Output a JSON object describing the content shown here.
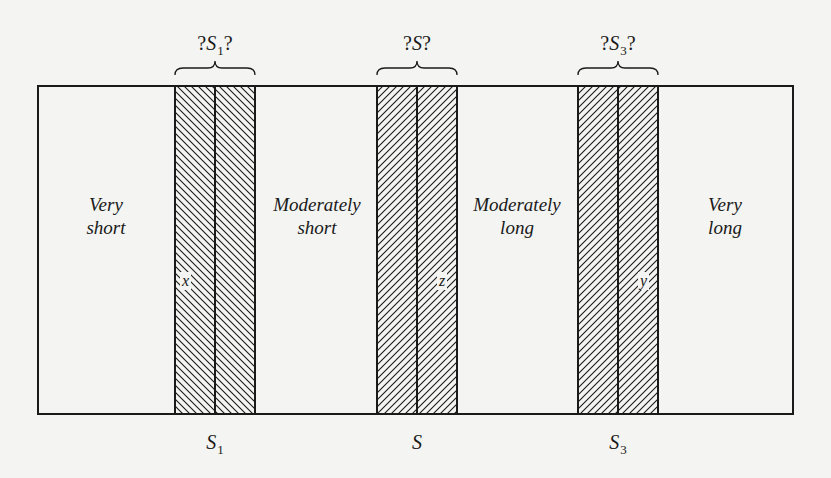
{
  "diagram": {
    "type": "interval-classification",
    "frame": {
      "x": 38,
      "y": 86,
      "width": 755,
      "height": 328
    },
    "colors": {
      "line": "#1a1a1a",
      "background": "#f4f4f2"
    },
    "regions": [
      {
        "id": "very-short",
        "line1": "Very",
        "line2": "short"
      },
      {
        "id": "moderately-short",
        "line1": "Moderately",
        "line2": "short"
      },
      {
        "id": "moderately-long",
        "line1": "Moderately",
        "line2": "long"
      },
      {
        "id": "very-long",
        "line1": "Very",
        "line2": "long"
      }
    ],
    "bands": [
      {
        "id": "s1",
        "bracket_label": {
          "prefix": "?",
          "symbol": "S",
          "subscript": "1",
          "suffix": "?"
        },
        "axis_label": {
          "symbol": "S",
          "subscript": "1"
        },
        "point_label": "x",
        "hatch": "backslash"
      },
      {
        "id": "s",
        "bracket_label": {
          "prefix": "?",
          "symbol": "S",
          "subscript": "",
          "suffix": "?"
        },
        "axis_label": {
          "symbol": "S",
          "subscript": ""
        },
        "point_label": "z",
        "hatch": "forward-slash"
      },
      {
        "id": "s3",
        "bracket_label": {
          "prefix": "?",
          "symbol": "S",
          "subscript": "3",
          "suffix": "?"
        },
        "axis_label": {
          "symbol": "S",
          "subscript": "3"
        },
        "point_label": "y",
        "hatch": "forward-slash"
      }
    ]
  }
}
